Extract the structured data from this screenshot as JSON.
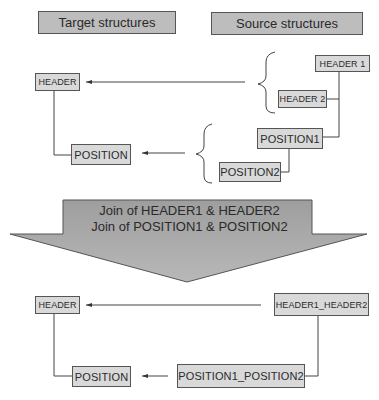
{
  "headers": {
    "target": "Target structures",
    "source": "Source structures"
  },
  "top": {
    "target_header": "HEADER",
    "target_position": "POSITION",
    "source_header1": "HEADER 1",
    "source_header2": "HEADER 2",
    "source_position1": "POSITION1",
    "source_position2": "POSITION2"
  },
  "join": {
    "line1": "Join of HEADER1 & HEADER2",
    "line2": "Join of POSITION1 & POSITION2"
  },
  "bottom": {
    "target_header": "HEADER",
    "target_position": "POSITION",
    "source_header": "HEADER1_HEADER2",
    "source_position": "POSITION1_POSITION2"
  },
  "colors": {
    "title_fill": "#bdbdbd",
    "node_fill": "#d9d9d9",
    "arrow_fill": "#a8a8a8",
    "line": "#444444"
  }
}
